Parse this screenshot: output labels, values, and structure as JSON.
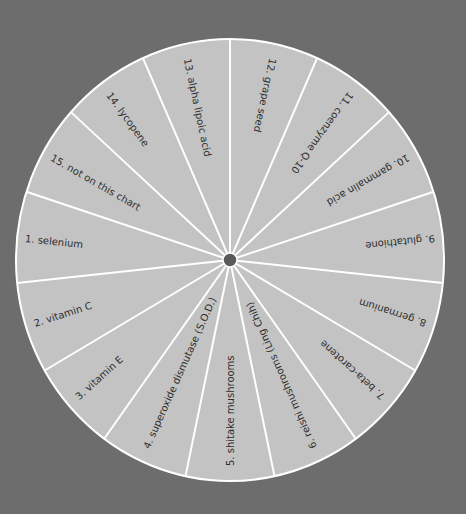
{
  "diagram": {
    "type": "wheel",
    "colors": {
      "background": "#6d6d6d",
      "segment_fill": "#c3c3c3",
      "divider": "#ffffff",
      "text": "#2e2e2e",
      "hub": "#5a5a5a"
    },
    "segments": [
      {
        "number": "1.",
        "label": "selenium"
      },
      {
        "number": "2.",
        "label": "vitamin C"
      },
      {
        "number": "3.",
        "label": "vitamin E"
      },
      {
        "number": "4.",
        "label": "superoxide dismutase (S.O.D.)"
      },
      {
        "number": "5.",
        "label": "shitake mushrooms"
      },
      {
        "number": "6.",
        "label": "reishi mushrooms (Ling Chih)"
      },
      {
        "number": "7.",
        "label": "beta-carotene"
      },
      {
        "number": "8.",
        "label": "germanium"
      },
      {
        "number": "9.",
        "label": "glutathione"
      },
      {
        "number": "10.",
        "label": "gammalin acid"
      },
      {
        "number": "11.",
        "label": "coenzyme Q-10"
      },
      {
        "number": "12.",
        "label": "grape seed"
      },
      {
        "number": "13.",
        "label": "alpha lipoic acid"
      },
      {
        "number": "14.",
        "label": "lycopene"
      },
      {
        "number": "15.",
        "label": "not on this chart"
      }
    ]
  }
}
